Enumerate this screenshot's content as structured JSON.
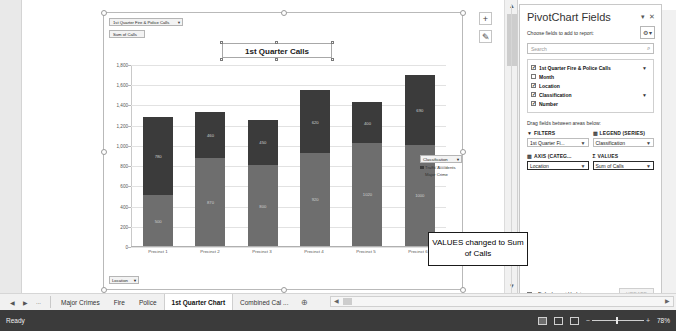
{
  "chart_object": {
    "field_buttons": [
      {
        "label": "1st Quarter Fire & Police Calls",
        "dropdown": "▼"
      },
      {
        "label": "Sum of Calls",
        "dropdown": ""
      }
    ],
    "axis_field_button": {
      "label": "Location",
      "dropdown": "▼"
    },
    "legend": {
      "header": "Classification",
      "dropdown": "▼",
      "items": [
        {
          "label": "Traffic Accidents",
          "color": "#3b3b3b"
        },
        {
          "label": "Major Crime",
          "color": "#6e6e6e"
        }
      ]
    },
    "side_buttons": [
      {
        "name": "chart-elements-plus",
        "glyph": "+"
      },
      {
        "name": "chart-styles-brush",
        "glyph": "✎"
      }
    ]
  },
  "chart_data": {
    "type": "bar",
    "subtype": "stacked-column",
    "title": "1st Quarter Calls",
    "xlabel": "",
    "ylabel": "",
    "ylim": [
      0,
      1800
    ],
    "yticks": [
      "0",
      "200",
      "400",
      "600",
      "800",
      "1,000",
      "1,200",
      "1,400",
      "1,600",
      "1,800"
    ],
    "ytick_values": [
      0,
      200,
      400,
      600,
      800,
      1000,
      1200,
      1400,
      1600,
      1800
    ],
    "grid": true,
    "legend_position": "right",
    "categories": [
      "Precinct 1",
      "Precinct 2",
      "Precinct 3",
      "Precinct 4",
      "Precinct 5",
      "Precinct 6"
    ],
    "series": [
      {
        "name": "Major Crime",
        "color": "#6e6e6e",
        "values": [
          500,
          870,
          800,
          920,
          1020,
          1000
        ]
      },
      {
        "name": "Traffic Accidents",
        "color": "#3b3b3b",
        "values": [
          780,
          460,
          450,
          620,
          400,
          690
        ]
      }
    ],
    "totals": [
      1280,
      1330,
      1250,
      1540,
      1420,
      1690
    ]
  },
  "callout": {
    "text": "VALUES changed to Sum of Calls"
  },
  "pane": {
    "title": "PivotChart Fields",
    "minimize_glyph": "▾",
    "close_glyph": "✕",
    "subtitle": "Choose fields to add to report:",
    "tools_glyph": "⚙",
    "tools_caret": "▾",
    "search_placeholder": "Search",
    "search_icon": "search-icon",
    "fields": [
      {
        "label": "1st Quarter Fire & Police Calls",
        "checked": true,
        "filter": true
      },
      {
        "label": "Month",
        "checked": false,
        "filter": false
      },
      {
        "label": "Location",
        "checked": true,
        "filter": false
      },
      {
        "label": "Classification",
        "checked": true,
        "filter": true
      },
      {
        "label": "Number",
        "checked": true,
        "filter": false
      }
    ],
    "drag_note": "Drag fields between areas below:",
    "areas": [
      {
        "key": "filters",
        "icon": "▼",
        "header": "FILTERS",
        "value": "1st Quarter Fi...",
        "caret": "▼"
      },
      {
        "key": "legend",
        "icon": "▥",
        "header": "LEGEND (SERIES)",
        "value": "Classification",
        "caret": "▼"
      },
      {
        "key": "axis",
        "icon": "▥",
        "header": "AXIS (CATEG...",
        "value": "Location",
        "caret": "▼"
      },
      {
        "key": "values",
        "icon": "Σ",
        "header": "VALUES",
        "value": "Sum of Calls",
        "caret": "▼"
      }
    ],
    "defer_label": "Defer Layout Update",
    "update_label": "UPDATE"
  },
  "credit": "Excel 2016, Windows 10, Microsoft Corporation",
  "tabbar": {
    "nav": [
      "◀",
      "▶",
      "..."
    ],
    "tabs": [
      {
        "label": "Major Crimes",
        "active": false
      },
      {
        "label": "Fire",
        "active": false
      },
      {
        "label": "Police",
        "active": false
      },
      {
        "label": "1st Quarter Chart",
        "active": true
      },
      {
        "label": "Combined Cal ...",
        "active": false
      }
    ],
    "add_sheet_glyph": "⊕"
  },
  "statusbar": {
    "mode": "Ready",
    "views": [
      "normal-view",
      "page-layout-view",
      "page-break-view"
    ],
    "zoom_out": "−",
    "zoom_in": "+",
    "zoom_level": "78%"
  },
  "scrollbars": {
    "v_up": "▲",
    "v_down": "▼",
    "h_left": "◀",
    "h_right": "▶"
  }
}
